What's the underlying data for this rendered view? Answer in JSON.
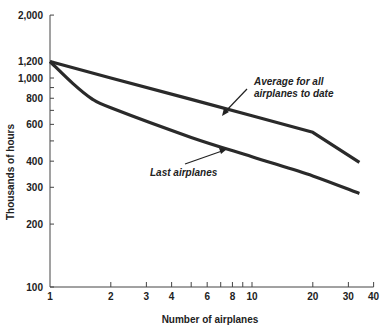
{
  "chart_data": {
    "type": "line",
    "title": "",
    "xlabel": "Number of airplanes",
    "ylabel": "Thousands of hours",
    "xscale": "log",
    "yscale": "log",
    "xlim": [
      1,
      40
    ],
    "ylim": [
      100,
      2000
    ],
    "grid": false,
    "x_ticks": [
      1,
      2,
      3,
      4,
      5,
      6,
      7,
      8,
      9,
      10,
      20,
      30,
      40
    ],
    "x_tick_labels": [
      {
        "value": 1,
        "label": "1"
      },
      {
        "value": 2,
        "label": "2"
      },
      {
        "value": 3,
        "label": "3"
      },
      {
        "value": 4,
        "label": "4"
      },
      {
        "value": 6,
        "label": "6"
      },
      {
        "value": 8,
        "label": "8"
      },
      {
        "value": 10,
        "label": "10"
      },
      {
        "value": 20,
        "label": "20"
      },
      {
        "value": 30,
        "label": "30"
      },
      {
        "value": 40,
        "label": "40"
      }
    ],
    "y_ticks": [
      100,
      200,
      300,
      400,
      500,
      600,
      700,
      800,
      900,
      1000,
      1200,
      2000
    ],
    "y_tick_labels": [
      {
        "value": 2000,
        "label": "2,000"
      },
      {
        "value": 1200,
        "label": "1,200"
      },
      {
        "value": 1000,
        "label": "1,000"
      },
      {
        "value": 800,
        "label": "800"
      },
      {
        "value": 600,
        "label": "600"
      },
      {
        "value": 400,
        "label": "400"
      },
      {
        "value": 300,
        "label": "300"
      },
      {
        "value": 200,
        "label": "200"
      },
      {
        "value": 100,
        "label": "100"
      }
    ],
    "series": [
      {
        "name": "Average for all airplanes to date",
        "x": [
          1,
          2,
          5,
          10,
          20,
          34
        ],
        "y": [
          1200,
          1000,
          790,
          660,
          550,
          395
        ]
      },
      {
        "name": "Last airplanes",
        "x": [
          1,
          1.3,
          1.6,
          2,
          5,
          10,
          20,
          34
        ],
        "y": [
          1200,
          940,
          800,
          720,
          520,
          420,
          340,
          280
        ]
      }
    ],
    "annotations": [
      {
        "text_line1": "Average for all",
        "text_line2": "airplanes to date",
        "points_to": "Average for all airplanes to date"
      },
      {
        "text": "Last airplanes",
        "points_to": "Last airplanes"
      }
    ],
    "legend": "none (inline annotations with arrows)"
  },
  "labels": {
    "xlabel": "Number of airplanes",
    "ylabel": "Thousands of hours",
    "annot_avg_1": "Average for all",
    "annot_avg_2": "airplanes to date",
    "annot_last": "Last airplanes"
  }
}
